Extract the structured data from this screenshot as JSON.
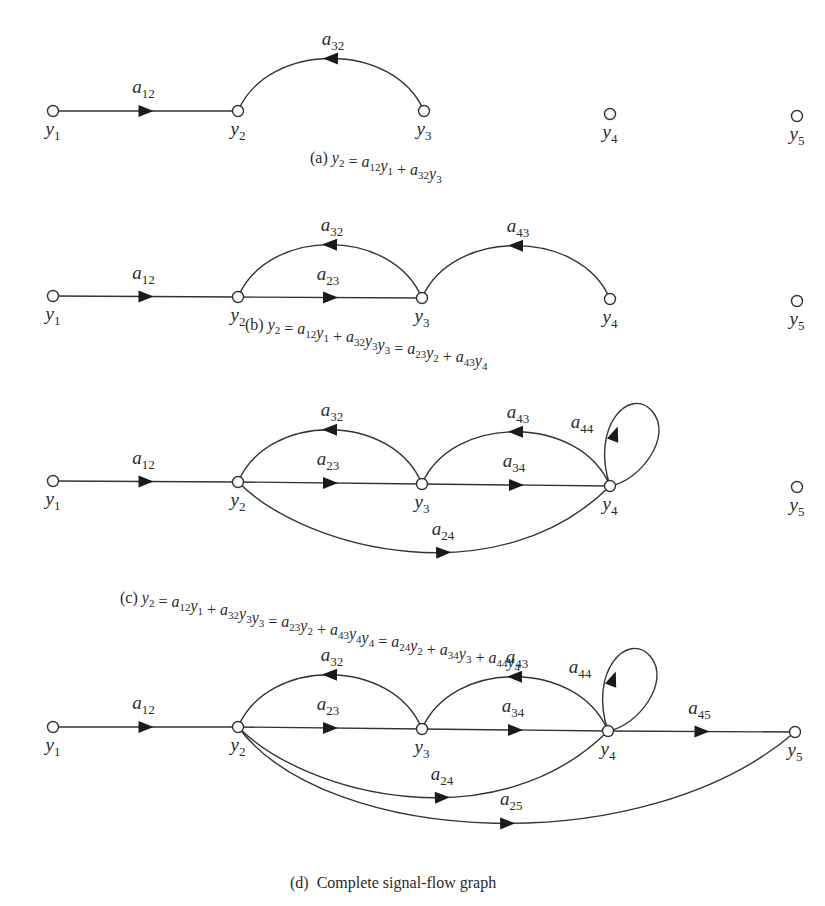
{
  "figure": {
    "panels": [
      {
        "id": "a",
        "caption_prefix": "(a)",
        "equations": [
          "y2 = a12y1 + a32y3"
        ],
        "nodes": [
          "y1",
          "y2",
          "y3",
          "y4",
          "y5"
        ],
        "edges": [
          {
            "from": "y1",
            "to": "y2",
            "gain": "a12"
          },
          {
            "from": "y3",
            "to": "y2",
            "gain": "a32"
          }
        ]
      },
      {
        "id": "b",
        "caption_prefix": "(b)",
        "equations": [
          "y2 = a12y1 + a32y3",
          "y3 = a23y2 + a43y4"
        ],
        "nodes": [
          "y1",
          "y2",
          "y3",
          "y4",
          "y5"
        ],
        "edges": [
          {
            "from": "y1",
            "to": "y2",
            "gain": "a12"
          },
          {
            "from": "y3",
            "to": "y2",
            "gain": "a32"
          },
          {
            "from": "y2",
            "to": "y3",
            "gain": "a23"
          },
          {
            "from": "y4",
            "to": "y3",
            "gain": "a43"
          }
        ]
      },
      {
        "id": "c",
        "caption_prefix": "(c)",
        "equations": [
          "y2 = a12y1 + a32y3",
          "y3 = a23y2 + a43y4",
          "y4 = a24y2 + a34y3 + a44y4"
        ],
        "nodes": [
          "y1",
          "y2",
          "y3",
          "y4",
          "y5"
        ],
        "edges": [
          {
            "from": "y1",
            "to": "y2",
            "gain": "a12"
          },
          {
            "from": "y3",
            "to": "y2",
            "gain": "a32"
          },
          {
            "from": "y2",
            "to": "y3",
            "gain": "a23"
          },
          {
            "from": "y4",
            "to": "y3",
            "gain": "a43"
          },
          {
            "from": "y3",
            "to": "y4",
            "gain": "a34"
          },
          {
            "from": "y4",
            "to": "y4",
            "gain": "a44"
          },
          {
            "from": "y2",
            "to": "y4",
            "gain": "a24"
          }
        ]
      },
      {
        "id": "d",
        "caption_prefix": "(d)",
        "caption_text": "Complete signal-flow graph",
        "nodes": [
          "y1",
          "y2",
          "y3",
          "y4",
          "y5"
        ],
        "edges": [
          {
            "from": "y1",
            "to": "y2",
            "gain": "a12"
          },
          {
            "from": "y3",
            "to": "y2",
            "gain": "a32"
          },
          {
            "from": "y2",
            "to": "y3",
            "gain": "a23"
          },
          {
            "from": "y4",
            "to": "y3",
            "gain": "a43"
          },
          {
            "from": "y3",
            "to": "y4",
            "gain": "a34"
          },
          {
            "from": "y4",
            "to": "y4",
            "gain": "a44"
          },
          {
            "from": "y2",
            "to": "y4",
            "gain": "a24"
          },
          {
            "from": "y4",
            "to": "y5",
            "gain": "a45"
          },
          {
            "from": "y2",
            "to": "y5",
            "gain": "a25"
          }
        ]
      }
    ],
    "colors": {
      "stroke": "#333333",
      "arrow": "#1a1a1a",
      "background": "#ffffff"
    }
  }
}
